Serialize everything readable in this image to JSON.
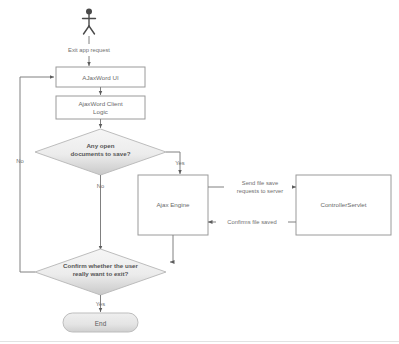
{
  "diagram": {
    "colors": {
      "page_background": "#ffffff",
      "box_fill": "#ffffff",
      "box_stroke": "#9a9a9a",
      "decision_fill_light": "#f4f4f4",
      "decision_fill_dark": "#dcdcdc",
      "decision_stroke": "#bdbdbd",
      "terminator_fill": "#e8e8e8",
      "line": "#808080",
      "text": "#5d5d5d",
      "actor": "#4a4a4a"
    },
    "actor": {
      "name": "user-actor",
      "label": ""
    },
    "nodes": [
      {
        "id": "actor",
        "type": "actor",
        "label": ""
      },
      {
        "id": "ui",
        "type": "process",
        "label": "AJaxWord UI"
      },
      {
        "id": "client_logic",
        "type": "process",
        "label": "AjaxWord Client Logic"
      },
      {
        "id": "decision_save",
        "type": "decision",
        "label_line1": "Any open",
        "label_line2": "documents to save?"
      },
      {
        "id": "ajax_engine",
        "type": "process",
        "label": "Ajax Engine"
      },
      {
        "id": "servlet",
        "type": "process",
        "label": "ControllerServlet"
      },
      {
        "id": "decision_exit",
        "type": "decision",
        "label_line1": "Confirm whether the user",
        "label_line2": "really want to exit?"
      },
      {
        "id": "end",
        "type": "terminator",
        "label": "End"
      }
    ],
    "edges": [
      {
        "id": "e_actor_ui",
        "from": "actor",
        "to": "ui",
        "label": "Exit app request"
      },
      {
        "id": "e_ui_logic",
        "from": "ui",
        "to": "client_logic",
        "label": ""
      },
      {
        "id": "e_logic_decision",
        "from": "client_logic",
        "to": "decision_save",
        "label": ""
      },
      {
        "id": "e_save_yes",
        "from": "decision_save",
        "to": "ajax_engine",
        "label": "Yes"
      },
      {
        "id": "e_save_no",
        "from": "decision_save",
        "to": "decision_exit",
        "label": "No"
      },
      {
        "id": "e_engine_servlet",
        "from": "ajax_engine",
        "to": "servlet",
        "label_line1": "Send file save",
        "label_line2": "requests to server"
      },
      {
        "id": "e_servlet_engine",
        "from": "servlet",
        "to": "ajax_engine",
        "label": "Confirms file saved"
      },
      {
        "id": "e_engine_exit",
        "from": "ajax_engine",
        "to": "decision_exit",
        "label": ""
      },
      {
        "id": "e_exit_no",
        "from": "decision_exit",
        "to": "ui",
        "label": "No"
      },
      {
        "id": "e_exit_yes",
        "from": "decision_exit",
        "to": "end",
        "label": "Yes"
      }
    ],
    "labels": {
      "exit_app_request": "Exit app request",
      "yes_save": "Yes",
      "no_save": "No",
      "no_exit": "No",
      "yes_exit": "Yes",
      "send_file_save_1": "Send file save",
      "send_file_save_2": "requests to server",
      "confirms_file_saved": "Confirms file saved",
      "ui_box": "AJaxWord UI",
      "client_logic_1": "AjaxWord Client",
      "client_logic_2": "Logic",
      "decision_save_1": "Any open",
      "decision_save_2": "documents to save?",
      "ajax_engine": "Ajax Engine",
      "controller_servlet": "ControllerServlet",
      "decision_exit_1": "Confirm whether the user",
      "decision_exit_2": "really want to exit?",
      "end": "End"
    }
  }
}
